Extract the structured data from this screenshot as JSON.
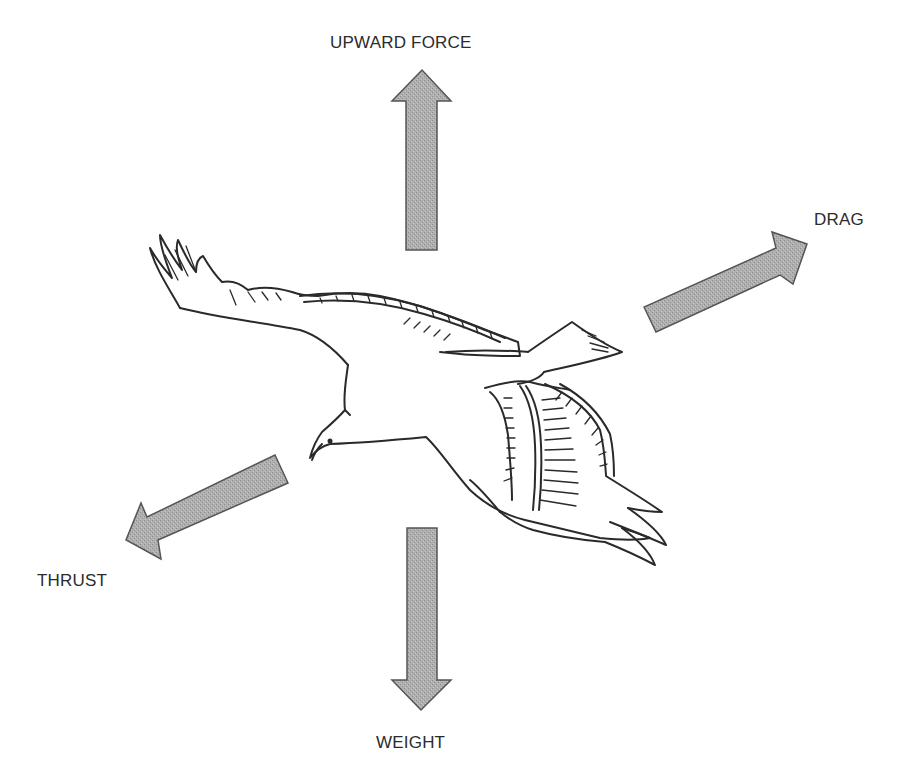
{
  "diagram": {
    "forces": [
      {
        "id": "upward",
        "label": "UPWARD FORCE",
        "direction": "up"
      },
      {
        "id": "drag",
        "label": "DRAG",
        "direction": "up-right"
      },
      {
        "id": "thrust",
        "label": "THRUST",
        "direction": "down-left"
      },
      {
        "id": "weight",
        "label": "WEIGHT",
        "direction": "down"
      }
    ],
    "colors": {
      "background": "#ffffff",
      "arrow_fill": "#a9a9a9",
      "arrow_stroke": "#555555",
      "line_ink": "#2a2a2a",
      "label_text": "#2b2b2b"
    }
  }
}
